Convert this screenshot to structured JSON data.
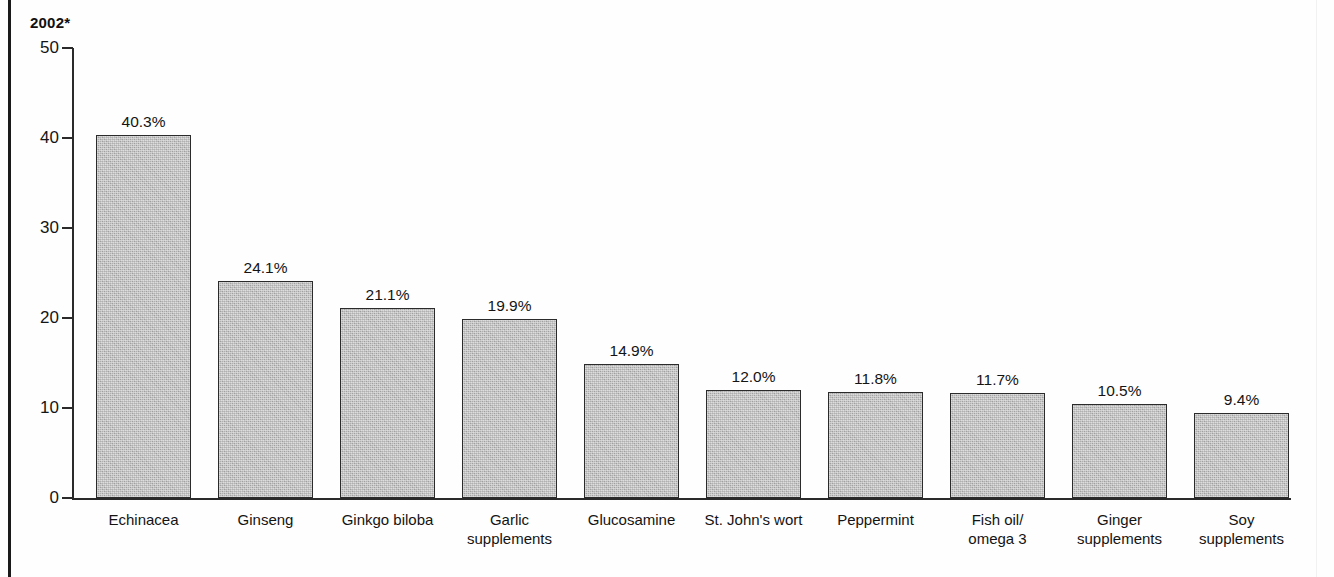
{
  "chart_data": {
    "type": "bar",
    "title": "2002*",
    "xlabel": "",
    "ylabel": "",
    "ylim": [
      0,
      50
    ],
    "yticks": [
      0,
      10,
      20,
      30,
      40,
      50
    ],
    "ytick_labels": [
      "0",
      "10",
      "20",
      "30",
      "40",
      "50"
    ],
    "grid": false,
    "legend": null,
    "categories": [
      "Echinacea",
      "Ginseng",
      "Ginkgo biloba",
      "Garlic\nsupplements",
      "Glucosamine",
      "St. John's wort",
      "Peppermint",
      "Fish oil/\nomega 3",
      "Ginger\nsupplements",
      "Soy\nsupplements"
    ],
    "values": [
      40.3,
      24.1,
      21.1,
      19.9,
      14.9,
      12.0,
      11.8,
      11.7,
      10.5,
      9.4
    ],
    "value_labels": [
      "40.3%",
      "24.1%",
      "21.1%",
      "19.9%",
      "14.9%",
      "12.0%",
      "11.8%",
      "11.7%",
      "10.5%",
      "9.4%"
    ],
    "bar_color": "#b0b0b0",
    "bar_edge_color": "#2b2b2b",
    "axis_color": "#2a2a2a",
    "text_color": "#141414"
  }
}
